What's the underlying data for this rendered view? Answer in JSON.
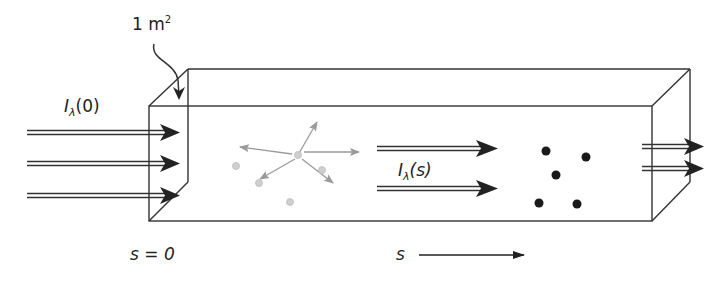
{
  "diagram": {
    "type": "radiative-transfer-slab",
    "labels": {
      "area": {
        "text": "1 m",
        "superscript": "2"
      },
      "incident_intensity": {
        "symbol": "I",
        "subscript": "λ",
        "arg": "(0)"
      },
      "transmitted_intensity": {
        "symbol": "I",
        "subscript": "λ",
        "arg": "(s)"
      },
      "start_position": "s = 0",
      "path_axis": "s"
    },
    "colors": {
      "line": "#333333",
      "arrow": "#222222",
      "scatter": "#9a9a9a",
      "scatter_dot": "#c8c8c8",
      "absorber": "#1a1a1a"
    },
    "incoming_arrows": 3,
    "middle_arrows": 2,
    "outgoing_arrows": 2,
    "scatter_arrows": 5,
    "scatter_particles": 4,
    "absorber_particles": 5
  }
}
